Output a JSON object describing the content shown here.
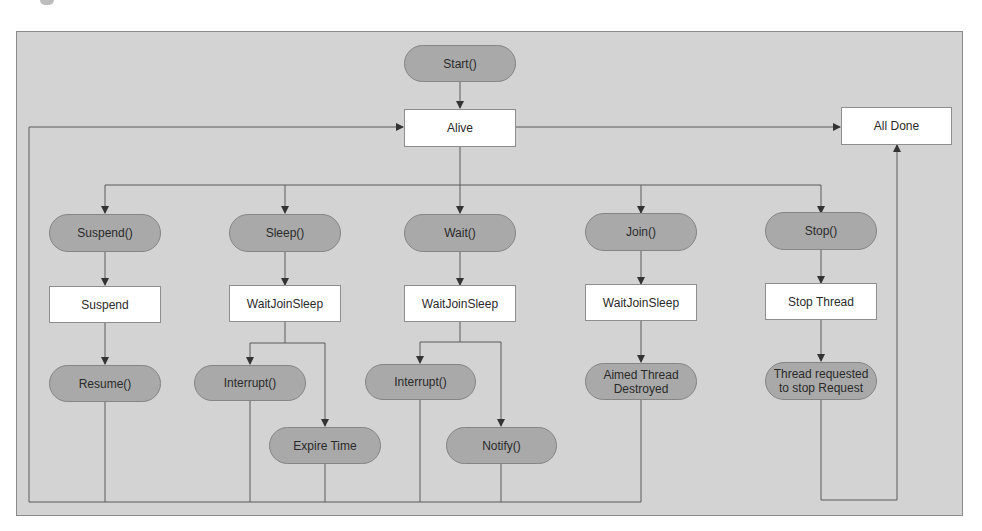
{
  "diagram": {
    "type": "flowchart",
    "title": "",
    "colors": {
      "background": "#d3d3d3",
      "action_fill": "#a9a9a9",
      "state_fill": "#ffffff",
      "line": "#555555"
    },
    "nodes": {
      "start": {
        "label": "Start()",
        "shape": "pill"
      },
      "alive": {
        "label": "Alive",
        "shape": "box"
      },
      "all_done": {
        "label": "All Done",
        "shape": "box"
      },
      "suspend_call": {
        "label": "Suspend()",
        "shape": "pill"
      },
      "sleep_call": {
        "label": "Sleep()",
        "shape": "pill"
      },
      "wait_call": {
        "label": "Wait()",
        "shape": "pill"
      },
      "join_call": {
        "label": "Join()",
        "shape": "pill"
      },
      "stop_call": {
        "label": "Stop()",
        "shape": "pill"
      },
      "suspend_state": {
        "label": "Suspend",
        "shape": "box"
      },
      "sleep_state": {
        "label": "WaitJoinSleep",
        "shape": "box"
      },
      "wait_state": {
        "label": "WaitJoinSleep",
        "shape": "box"
      },
      "join_state": {
        "label": "WaitJoinSleep",
        "shape": "box"
      },
      "stop_state": {
        "label": "Stop Thread",
        "shape": "box"
      },
      "resume": {
        "label": "Resume()",
        "shape": "pill"
      },
      "sleep_interrupt": {
        "label": "Interrupt()",
        "shape": "pill"
      },
      "expire_time": {
        "label": "Expire Time",
        "shape": "pill"
      },
      "wait_interrupt": {
        "label": "Interrupt()",
        "shape": "pill"
      },
      "notify": {
        "label": "Notify()",
        "shape": "pill"
      },
      "aimed_destroyed": {
        "label_line1": "Aimed Thread",
        "label_line2": "Destroyed",
        "shape": "pill"
      },
      "stop_request": {
        "label_line1": "Thread requested",
        "label_line2": "to stop Request",
        "shape": "pill"
      }
    },
    "edges": [
      {
        "from": "start",
        "to": "alive"
      },
      {
        "from": "alive",
        "to": "all_done"
      },
      {
        "from": "alive",
        "to": "suspend_call"
      },
      {
        "from": "alive",
        "to": "sleep_call"
      },
      {
        "from": "alive",
        "to": "wait_call"
      },
      {
        "from": "alive",
        "to": "join_call"
      },
      {
        "from": "alive",
        "to": "stop_call"
      },
      {
        "from": "suspend_call",
        "to": "suspend_state"
      },
      {
        "from": "sleep_call",
        "to": "sleep_state"
      },
      {
        "from": "wait_call",
        "to": "wait_state"
      },
      {
        "from": "join_call",
        "to": "join_state"
      },
      {
        "from": "stop_call",
        "to": "stop_state"
      },
      {
        "from": "suspend_state",
        "to": "resume"
      },
      {
        "from": "sleep_state",
        "to": "sleep_interrupt"
      },
      {
        "from": "sleep_state",
        "to": "expire_time"
      },
      {
        "from": "wait_state",
        "to": "wait_interrupt"
      },
      {
        "from": "wait_state",
        "to": "notify"
      },
      {
        "from": "join_state",
        "to": "aimed_destroyed"
      },
      {
        "from": "stop_state",
        "to": "stop_request"
      },
      {
        "from": "resume",
        "to": "alive"
      },
      {
        "from": "sleep_interrupt",
        "to": "alive"
      },
      {
        "from": "expire_time",
        "to": "alive"
      },
      {
        "from": "wait_interrupt",
        "to": "alive"
      },
      {
        "from": "notify",
        "to": "alive"
      },
      {
        "from": "aimed_destroyed",
        "to": "alive"
      },
      {
        "from": "stop_request",
        "to": "all_done"
      }
    ]
  }
}
